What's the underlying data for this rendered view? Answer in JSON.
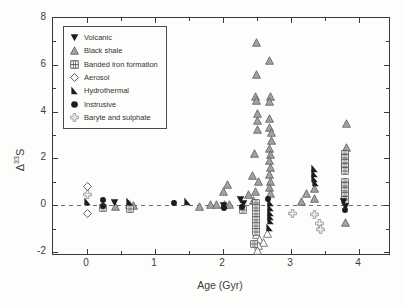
{
  "figure_title": "Delta-33S vs Age scatter plot",
  "axes": {
    "y_label": {
      "base": "Δ",
      "sup": "33",
      "tail": "S"
    },
    "x_label": "Age (Gyr)"
  },
  "legend": {
    "items": [
      {
        "label": "Volcanic",
        "marker": "volcanic"
      },
      {
        "label": "Black shale",
        "marker": "black_shale"
      },
      {
        "label": "Banded iron formation",
        "marker": "bif"
      },
      {
        "label": "Aerosol",
        "marker": "aerosol"
      },
      {
        "label": "Hydrothermal",
        "marker": "hydrothermal"
      },
      {
        "label": "Instrusive",
        "marker": "intrusive"
      },
      {
        "label": "Baryte and sulphate",
        "marker": "baryte"
      }
    ]
  },
  "colors": {
    "black": "#1c1c1c",
    "gray_fill": "#a2a2a2",
    "gray_stroke": "#5f5f5f",
    "open_fill": "#ffffff",
    "baryte_fill": "#ededed",
    "baryte_stroke": "#8f8f8f",
    "axis": "#3a3a3a"
  },
  "chart_data": {
    "type": "scatter",
    "title": "",
    "xlabel": "Age (Gyr)",
    "ylabel": "Δ33S",
    "xlim": [
      -0.5,
      4.44
    ],
    "ylim": [
      -2.09,
      8
    ],
    "x_ticks": [
      0,
      1,
      2,
      3,
      4
    ],
    "y_ticks": [
      -2,
      0,
      2,
      4,
      6,
      8
    ],
    "x_minor_step": 0.5,
    "y_minor_step": 1,
    "grid": false,
    "zero_line": "dashed",
    "legend_position": "upper-left",
    "series": [
      {
        "name": "Black shale",
        "marker": "black_shale",
        "points": [
          [
            0.42,
            -0.05
          ],
          [
            0.63,
            0.04
          ],
          [
            0.68,
            -0.03
          ],
          [
            1.65,
            -0.05
          ],
          [
            1.82,
            0.04
          ],
          [
            1.9,
            0.02
          ],
          [
            2.0,
            0.6
          ],
          [
            2.02,
            0.03
          ],
          [
            2.1,
            0.02
          ],
          [
            2.07,
            0.9
          ],
          [
            2.38,
            0.45
          ],
          [
            2.45,
            0.18
          ],
          [
            2.47,
            0.6
          ],
          [
            2.44,
            1.25
          ],
          [
            2.52,
            1.0
          ],
          [
            2.46,
            2.2
          ],
          [
            2.51,
            3.25
          ],
          [
            2.51,
            3.6
          ],
          [
            2.51,
            3.9
          ],
          [
            2.48,
            4.65
          ],
          [
            2.49,
            4.48
          ],
          [
            2.49,
            5.6
          ],
          [
            2.49,
            6.95
          ],
          [
            2.68,
            6.2
          ],
          [
            2.7,
            4.65
          ],
          [
            2.69,
            4.45
          ],
          [
            2.68,
            3.7
          ],
          [
            2.69,
            3.3
          ],
          [
            2.71,
            3.12
          ],
          [
            2.71,
            2.75
          ],
          [
            2.69,
            2.4
          ],
          [
            2.7,
            2.18
          ],
          [
            2.68,
            1.9
          ],
          [
            2.7,
            1.6
          ],
          [
            2.69,
            1.3
          ],
          [
            2.7,
            1.0
          ],
          [
            2.68,
            0.75
          ],
          [
            2.7,
            0.5
          ],
          [
            3.16,
            0.17
          ],
          [
            3.22,
            0.51
          ],
          [
            3.34,
            0.73
          ],
          [
            3.34,
            0.3
          ],
          [
            3.81,
            3.5
          ],
          [
            3.81,
            2.45
          ],
          [
            3.8,
            -0.75
          ]
        ]
      },
      {
        "name": "Black shale (open)",
        "marker": "black_shale_open",
        "points": [
          [
            2.49,
            -1.25
          ],
          [
            2.54,
            -1.45
          ],
          [
            2.59,
            -1.58
          ],
          [
            2.52,
            -1.72
          ],
          [
            2.5,
            -1.92
          ],
          [
            2.66,
            -1.2
          ]
        ]
      },
      {
        "name": "Banded iron formation",
        "marker": "bif",
        "points": [
          [
            0.24,
            -0.13
          ],
          [
            0.63,
            -0.15
          ],
          [
            2.3,
            -0.2
          ],
          [
            2.49,
            0.08
          ],
          [
            2.49,
            -0.12
          ],
          [
            2.49,
            -0.38
          ],
          [
            2.49,
            -0.64
          ],
          [
            2.49,
            -0.9
          ],
          [
            2.49,
            -1.15
          ],
          [
            2.46,
            -1.67
          ],
          [
            3.79,
            2.2
          ],
          [
            3.79,
            2.0
          ],
          [
            3.79,
            1.82
          ],
          [
            3.79,
            1.63
          ],
          [
            3.79,
            1.45
          ],
          [
            3.79,
            1.0
          ],
          [
            3.79,
            0.8
          ],
          [
            3.79,
            0.6
          ],
          [
            3.79,
            0.4
          ],
          [
            3.79,
            0.2
          ]
        ]
      },
      {
        "name": "Baryte and sulphate",
        "marker": "baryte",
        "points": [
          [
            0.0,
            0.45
          ],
          [
            3.02,
            -0.35
          ],
          [
            3.34,
            -0.38
          ],
          [
            3.42,
            -0.78
          ],
          [
            3.43,
            -1.05
          ]
        ]
      },
      {
        "name": "Aerosol",
        "marker": "aerosol",
        "points": [
          [
            0.0,
            0.8
          ],
          [
            0.0,
            -0.35
          ]
        ]
      },
      {
        "name": "Hydrothermal",
        "marker": "hydrothermal",
        "points": [
          [
            0.0,
            0.15
          ],
          [
            0.62,
            0.15
          ],
          [
            1.48,
            0.17
          ],
          [
            2.7,
            0.1
          ],
          [
            2.7,
            -0.1
          ],
          [
            2.7,
            -0.3
          ],
          [
            2.7,
            -0.48
          ],
          [
            2.7,
            -0.65
          ],
          [
            2.68,
            -0.95
          ],
          [
            3.35,
            1.55
          ],
          [
            3.35,
            1.35
          ],
          [
            3.35,
            1.15
          ],
          [
            3.36,
            0.98
          ]
        ]
      },
      {
        "name": "Volcanic",
        "marker": "volcanic",
        "points": [
          [
            0.4,
            0.1
          ],
          [
            2.0,
            0.0
          ],
          [
            2.26,
            0.25
          ],
          [
            2.3,
            0.05
          ],
          [
            3.77,
            0.15
          ],
          [
            3.8,
            -0.05
          ]
        ]
      },
      {
        "name": "Instrusive",
        "marker": "intrusive",
        "points": [
          [
            0.23,
            0.22
          ],
          [
            0.24,
            -0.02
          ],
          [
            1.28,
            0.08
          ],
          [
            2.02,
            -0.12
          ],
          [
            2.28,
            -0.1
          ],
          [
            2.66,
            0.28
          ],
          [
            3.79,
            -0.2
          ]
        ]
      }
    ]
  }
}
